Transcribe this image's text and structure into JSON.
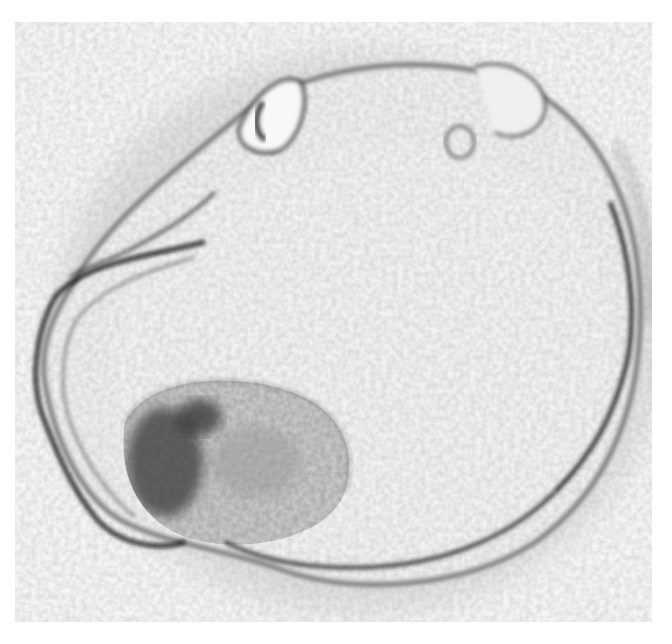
{
  "image": {
    "subject": "Grayscale DIC micrograph of an embryo (blastocyst-like) with fluid-filled cavity, granular inner cell mass at lower left, and a collapsed outer membrane on the left edge",
    "colors": {
      "background": "#ffffff",
      "field": "#f6f6f6",
      "cavity": "#ededed",
      "outline_dark": "#1a1a1a",
      "cell_mass": "#9a9a9a"
    },
    "frame": {
      "left": 15,
      "top": 22,
      "width": 637,
      "height": 600
    }
  }
}
